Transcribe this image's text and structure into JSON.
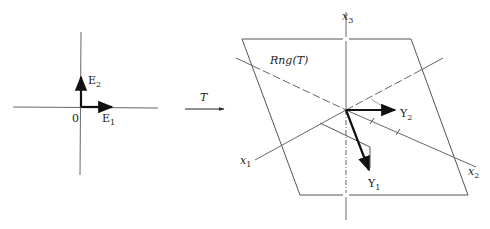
{
  "figure": {
    "left_panel": {
      "origin_label": "0",
      "vectors": [
        {
          "name": "E",
          "sub": "1",
          "direction": "x"
        },
        {
          "name": "E",
          "sub": "2",
          "direction": "y"
        }
      ]
    },
    "mapping": {
      "label": "T"
    },
    "right_panel": {
      "plane_label": "𝓇ng(T)",
      "plane_label_plain": "Rng(T)",
      "axes": [
        {
          "name": "x",
          "sub": "1"
        },
        {
          "name": "x",
          "sub": "2"
        },
        {
          "name": "x",
          "sub": "3"
        }
      ],
      "vectors": [
        {
          "name": "Y",
          "sub": "1"
        },
        {
          "name": "Y",
          "sub": "2"
        }
      ]
    },
    "colors": {
      "line": "#555555",
      "vector": "#111111",
      "background": "#ffffff"
    }
  }
}
